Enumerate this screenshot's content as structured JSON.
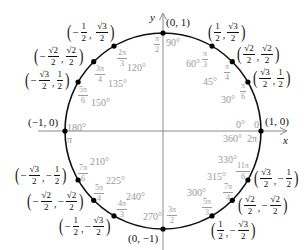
{
  "diagram": {
    "center": {
      "x": 163,
      "y": 131
    },
    "radius": 98,
    "colors": {
      "circle": "#111111",
      "axis": "#8a8a8a",
      "point": "#000000",
      "angle_label": "#9a9a9a",
      "coord_label": "#111111"
    },
    "axes": {
      "x_label": "x",
      "y_label": "y"
    },
    "points": [
      {
        "deg": 0,
        "degree_label": "0°",
        "radian": {
          "num": "0",
          "den": ""
        },
        "coord": {
          "x": "1",
          "y": "0"
        }
      },
      {
        "deg": 30,
        "degree_label": "30°",
        "radian": {
          "num": "π",
          "den": "6"
        },
        "coord": {
          "x": "√3/2",
          "y": "1/2"
        }
      },
      {
        "deg": 45,
        "degree_label": "45°",
        "radian": {
          "num": "π",
          "den": "4"
        },
        "coord": {
          "x": "√2/2",
          "y": "√2/2"
        }
      },
      {
        "deg": 60,
        "degree_label": "60°",
        "radian": {
          "num": "π",
          "den": "3"
        },
        "coord": {
          "x": "1/2",
          "y": "√3/2"
        }
      },
      {
        "deg": 90,
        "degree_label": "90°",
        "radian": {
          "num": "π",
          "den": "2"
        },
        "coord": {
          "x": "0",
          "y": "1"
        }
      },
      {
        "deg": 120,
        "degree_label": "120°",
        "radian": {
          "num": "2π",
          "den": "3"
        },
        "coord": {
          "x": "−1/2",
          "y": "√3/2"
        }
      },
      {
        "deg": 135,
        "degree_label": "135°",
        "radian": {
          "num": "3π",
          "den": "4"
        },
        "coord": {
          "x": "−√2/2",
          "y": "√2/2"
        }
      },
      {
        "deg": 150,
        "degree_label": "150°",
        "radian": {
          "num": "5π",
          "den": "6"
        },
        "coord": {
          "x": "−√3/2",
          "y": "1/2"
        }
      },
      {
        "deg": 180,
        "degree_label": "180°",
        "radian": {
          "num": "π",
          "den": ""
        },
        "coord": {
          "x": "−1",
          "y": "0"
        }
      },
      {
        "deg": 210,
        "degree_label": "210°",
        "radian": {
          "num": "7π",
          "den": "6"
        },
        "coord": {
          "x": "−√3/2",
          "y": "−1/2"
        }
      },
      {
        "deg": 225,
        "degree_label": "225°",
        "radian": {
          "num": "5π",
          "den": "4"
        },
        "coord": {
          "x": "−√2/2",
          "y": "−√2/2"
        }
      },
      {
        "deg": 240,
        "degree_label": "240°",
        "radian": {
          "num": "4π",
          "den": "3"
        },
        "coord": {
          "x": "−1/2",
          "y": "−√3/2"
        }
      },
      {
        "deg": 270,
        "degree_label": "270°",
        "radian": {
          "num": "3π",
          "den": "2"
        },
        "coord": {
          "x": "0",
          "y": "−1"
        }
      },
      {
        "deg": 300,
        "degree_label": "300°",
        "radian": {
          "num": "5π",
          "den": "3"
        },
        "coord": {
          "x": "1/2",
          "y": "−√3/2"
        }
      },
      {
        "deg": 315,
        "degree_label": "315°",
        "radian": {
          "num": "7π",
          "den": "4"
        },
        "coord": {
          "x": "√2/2",
          "y": "−√2/2"
        }
      },
      {
        "deg": 330,
        "degree_label": "330°",
        "radian": {
          "num": "11π",
          "den": "6"
        },
        "coord": {
          "x": "√3/2",
          "y": "−1/2"
        }
      }
    ],
    "extra_labels": {
      "deg_360": "360°",
      "rad_2pi": "2π",
      "rad_0": "0"
    }
  },
  "text": {
    "c0_x": "1",
    "c0_y": "0",
    "c90_x": "0",
    "c90_y": "1",
    "c180_x": "−1",
    "c180_y": "0",
    "c270_x": "0",
    "c270_y": "−1",
    "half": {
      "num": "1",
      "den": "2"
    },
    "r3half": {
      "num": "√3",
      "den": "2"
    },
    "r2half": {
      "num": "√2",
      "den": "2"
    },
    "minus": "−",
    "comma": ",",
    "lparen": "(",
    "rparen": ")",
    "d0": "0°",
    "d30": "30°",
    "d45": "45°",
    "d60": "60°",
    "d90": "90°",
    "d120": "120°",
    "d135": "135°",
    "d150": "150°",
    "d180": "180°",
    "d210": "210°",
    "d225": "225°",
    "d240": "240°",
    "d270": "270°",
    "d300": "300°",
    "d315": "315°",
    "d330": "330°",
    "d360": "360°",
    "pi": "π",
    "twopi": "2π",
    "zero": "0",
    "n2pi": "2π",
    "n3pi": "3π",
    "n4pi": "4π",
    "n5pi": "5π",
    "n7pi": "7π",
    "n11pi": "11π",
    "den2": "2",
    "den3": "3",
    "den4": "4",
    "den6": "6",
    "xlab": "x",
    "ylab": "y"
  }
}
